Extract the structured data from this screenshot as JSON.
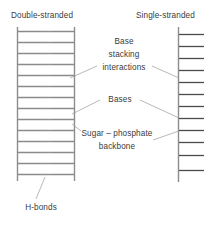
{
  "figure": {
    "background_color": "#ffffff",
    "text_color": "#3b3b3b",
    "strand_color": "#8c8c8c",
    "rung_color": "#8a8a8a",
    "leader_color": "#9a9a9a"
  },
  "headings": {
    "left": "Double-stranded",
    "right": "Single-stranded"
  },
  "annotations": {
    "base_stacking": {
      "line1": "Base",
      "line2": "stacking",
      "line3": "interactions"
    },
    "bases": "Bases",
    "sugar_phosphate": {
      "line1": "Sugar – phosphate",
      "line2": "backbone"
    },
    "h_bonds": "H-bonds"
  },
  "diagram_data": {
    "type": "diagram",
    "left_structure": {
      "name": "double-stranded",
      "backbones": 2,
      "rung_count": 14,
      "rung_feature": "dotted-hydrogen-bond-gap"
    },
    "right_structure": {
      "name": "single-stranded",
      "backbones": 1,
      "rung_count": 12,
      "rung_feature": "unpaired-base-stub"
    }
  }
}
